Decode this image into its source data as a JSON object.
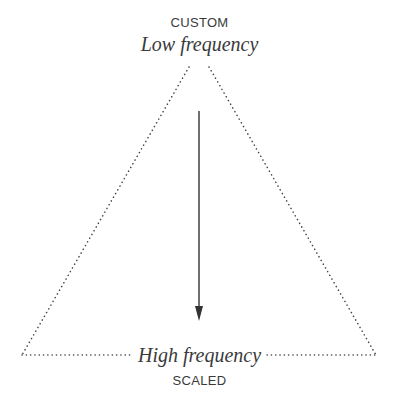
{
  "diagram": {
    "type": "triangle-spectrum",
    "top": {
      "category": "CUSTOM",
      "label": "Low frequency"
    },
    "bottom": {
      "category": "SCALED",
      "label": "High frequency"
    },
    "arrow": {
      "direction": "down",
      "from": "Low frequency",
      "to": "High frequency"
    },
    "colors": {
      "text": "#3a3a3a",
      "lines": "#444444",
      "background": "#ffffff"
    }
  }
}
